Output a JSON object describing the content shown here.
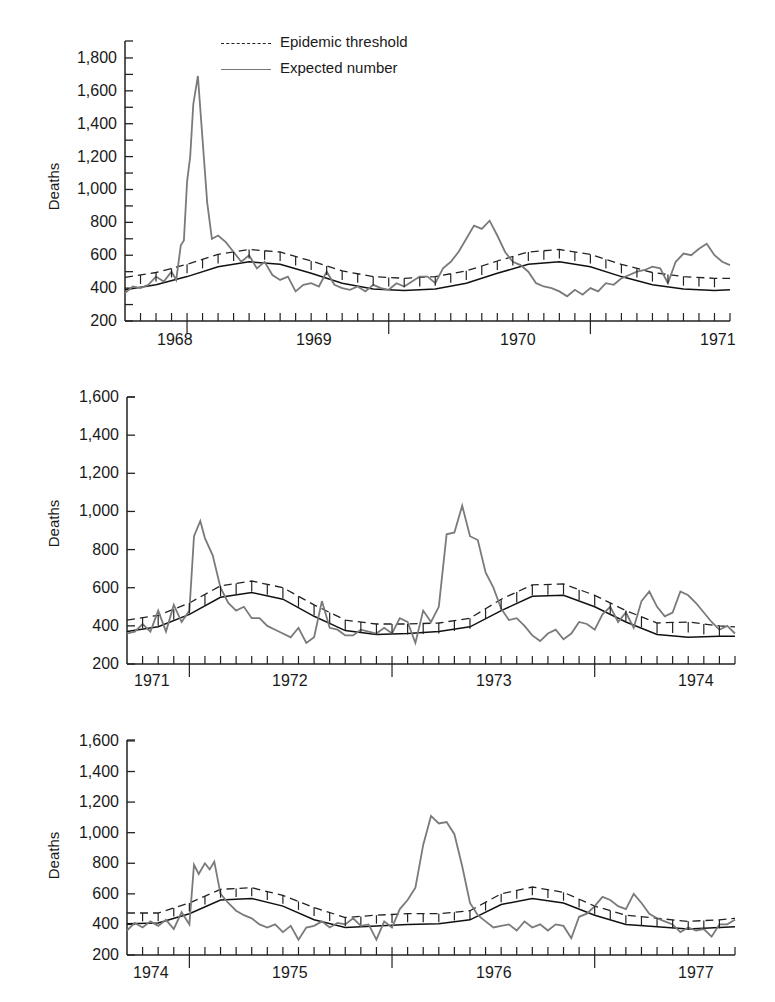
{
  "legend": {
    "threshold_label": "Epidemic threshold",
    "expected_label": "Expected number"
  },
  "colors": {
    "observed": "#7a7a7a",
    "expected": "#111111",
    "threshold": "#222222",
    "axis": "#222222"
  },
  "chart_data": [
    {
      "type": "line",
      "title": "",
      "xlabel": "",
      "ylabel": "Deaths",
      "ylim": [
        200,
        1900
      ],
      "yticks": [
        "200",
        "400",
        "600",
        "800",
        "1,000",
        "1,200",
        "1,400",
        "1,600",
        "1,800"
      ],
      "years": [
        "1968",
        "1969",
        "1970",
        "1971"
      ],
      "legend_position": "top",
      "grid": false,
      "periods_per_unit": "4-week periods (ticks)",
      "x_range_periods": [
        0,
        39
      ],
      "year_boundaries_periods": [
        4,
        17,
        30
      ],
      "series": [
        {
          "name": "Epidemic threshold",
          "style": "dashed",
          "x": [
            0,
            2,
            4,
            6,
            8,
            10,
            12,
            14,
            16,
            18,
            20,
            22,
            24,
            26,
            28,
            30,
            32,
            34,
            36,
            38,
            39
          ],
          "values": [
            465,
            495,
            545,
            605,
            635,
            620,
            565,
            505,
            470,
            460,
            470,
            505,
            565,
            620,
            635,
            605,
            545,
            495,
            470,
            460,
            460
          ]
        },
        {
          "name": "Expected number",
          "style": "solid",
          "x": [
            0,
            2,
            4,
            6,
            8,
            10,
            12,
            14,
            16,
            18,
            20,
            22,
            24,
            26,
            28,
            30,
            32,
            34,
            36,
            38,
            39
          ],
          "values": [
            390,
            420,
            470,
            530,
            560,
            545,
            490,
            430,
            395,
            385,
            395,
            430,
            490,
            545,
            560,
            530,
            470,
            420,
            395,
            385,
            390
          ]
        },
        {
          "name": "Observed",
          "style": "solid-gray",
          "x": [
            0,
            0.5,
            1,
            1.5,
            2,
            2.5,
            3,
            3.3,
            3.6,
            3.8,
            4,
            4.2,
            4.4,
            4.7,
            5,
            5.3,
            5.6,
            6,
            6.5,
            7,
            7.5,
            8,
            8.5,
            9,
            9.5,
            10,
            10.5,
            11,
            11.5,
            12,
            12.5,
            13,
            13.5,
            14,
            14.5,
            15,
            15.5,
            16,
            16.5,
            17,
            17.5,
            18,
            18.5,
            19,
            19.5,
            20,
            20.5,
            21,
            21.5,
            22,
            22.5,
            23,
            23.5,
            24,
            24.5,
            25,
            25.5,
            26,
            26.5,
            27,
            27.5,
            28,
            28.5,
            29,
            29.5,
            30,
            30.5,
            31,
            31.5,
            32,
            32.5,
            33,
            33.5,
            34,
            34.5,
            35,
            35.5,
            36,
            36.5,
            37,
            37.5,
            38,
            38.5,
            39
          ],
          "values": [
            370,
            410,
            400,
            420,
            470,
            440,
            500,
            450,
            660,
            690,
            1050,
            1200,
            1520,
            1690,
            1300,
            920,
            700,
            720,
            680,
            620,
            560,
            600,
            520,
            560,
            480,
            450,
            470,
            380,
            420,
            430,
            410,
            500,
            420,
            400,
            390,
            410,
            380,
            420,
            400,
            390,
            430,
            410,
            440,
            470,
            470,
            430,
            520,
            560,
            620,
            700,
            780,
            760,
            810,
            720,
            620,
            560,
            540,
            500,
            430,
            410,
            400,
            380,
            350,
            390,
            360,
            400,
            380,
            430,
            420,
            460,
            480,
            500,
            510,
            530,
            520,
            430,
            560,
            610,
            600,
            640,
            670,
            600,
            560,
            540,
            470,
            420,
            410,
            390,
            420,
            400,
            380,
            330
          ]
        }
      ]
    },
    {
      "type": "line",
      "title": "",
      "xlabel": "",
      "ylabel": "Deaths",
      "ylim": [
        200,
        1600
      ],
      "yticks": [
        "200",
        "400",
        "600",
        "800",
        "1,000",
        "1,200",
        "1,400",
        "1,600"
      ],
      "years": [
        "1971",
        "1972",
        "1973",
        "1974"
      ],
      "grid": false,
      "x_range_periods": [
        0,
        39
      ],
      "year_boundaries_periods": [
        4,
        17,
        30
      ],
      "series": [
        {
          "name": "Epidemic threshold",
          "style": "dashed",
          "x": [
            0,
            2,
            4,
            6,
            8,
            10,
            12,
            14,
            16,
            18,
            20,
            22,
            24,
            26,
            28,
            30,
            32,
            34,
            36,
            38,
            39
          ],
          "values": [
            430,
            455,
            520,
            610,
            635,
            600,
            510,
            430,
            410,
            410,
            415,
            440,
            540,
            615,
            620,
            560,
            480,
            415,
            420,
            400,
            395
          ]
        },
        {
          "name": "Expected number",
          "style": "solid",
          "x": [
            0,
            2,
            4,
            6,
            8,
            10,
            12,
            14,
            16,
            18,
            20,
            22,
            24,
            26,
            28,
            30,
            32,
            34,
            36,
            38,
            39
          ],
          "values": [
            370,
            395,
            460,
            550,
            575,
            540,
            450,
            375,
            355,
            360,
            370,
            395,
            480,
            555,
            560,
            500,
            420,
            355,
            340,
            345,
            345
          ]
        },
        {
          "name": "Observed",
          "style": "solid-gray",
          "x": [
            0,
            0.5,
            1,
            1.5,
            2,
            2.5,
            3,
            3.5,
            4,
            4.3,
            4.7,
            5,
            5.5,
            6,
            6.5,
            7,
            7.5,
            8,
            8.5,
            9,
            9.5,
            10,
            10.5,
            11,
            11.5,
            12,
            12.5,
            13,
            13.5,
            14,
            14.5,
            15,
            15.5,
            16,
            16.5,
            17,
            17.5,
            18,
            18.5,
            19,
            19.5,
            20,
            20.5,
            21,
            21.5,
            22,
            22.5,
            23,
            23.5,
            24,
            24.5,
            25,
            25.5,
            26,
            26.5,
            27,
            27.5,
            28,
            28.5,
            29,
            29.5,
            30,
            30.5,
            31,
            31.5,
            32,
            32.5,
            33,
            33.5,
            34,
            34.5,
            35,
            35.5,
            36,
            36.5,
            37,
            37.5,
            38,
            38.5,
            39
          ],
          "values": [
            360,
            370,
            410,
            370,
            480,
            370,
            510,
            420,
            480,
            870,
            950,
            860,
            770,
            600,
            520,
            480,
            500,
            440,
            440,
            400,
            380,
            360,
            340,
            390,
            310,
            340,
            530,
            390,
            380,
            350,
            350,
            380,
            370,
            360,
            390,
            360,
            440,
            420,
            310,
            480,
            420,
            500,
            880,
            890,
            1030,
            870,
            850,
            680,
            600,
            490,
            430,
            440,
            400,
            350,
            320,
            360,
            380,
            330,
            360,
            420,
            410,
            380,
            460,
            500,
            420,
            470,
            390,
            530,
            580,
            500,
            450,
            470,
            580,
            560,
            520,
            470,
            420,
            380,
            400,
            360,
            340,
            330,
            350
          ]
        }
      ]
    },
    {
      "type": "line",
      "title": "",
      "xlabel": "",
      "ylabel": "Deaths",
      "ylim": [
        200,
        1600
      ],
      "yticks": [
        "200",
        "400",
        "600",
        "800",
        "1,000",
        "1,200",
        "1,400",
        "1,600"
      ],
      "years": [
        "1974",
        "1975",
        "1976",
        "1977"
      ],
      "grid": false,
      "x_range_periods": [
        0,
        39
      ],
      "year_boundaries_periods": [
        4,
        17,
        30
      ],
      "series": [
        {
          "name": "Epidemic threshold",
          "style": "dashed",
          "x": [
            0,
            2,
            4,
            6,
            8,
            10,
            12,
            14,
            16,
            18,
            20,
            22,
            24,
            26,
            28,
            30,
            32,
            34,
            36,
            38,
            39
          ],
          "values": [
            475,
            475,
            540,
            630,
            640,
            590,
            510,
            445,
            460,
            470,
            470,
            490,
            600,
            645,
            610,
            520,
            460,
            440,
            420,
            430,
            440
          ]
        },
        {
          "name": "Expected number",
          "style": "solid",
          "x": [
            0,
            2,
            4,
            6,
            8,
            10,
            12,
            14,
            16,
            18,
            20,
            22,
            24,
            26,
            28,
            30,
            32,
            34,
            36,
            38,
            39
          ],
          "values": [
            405,
            410,
            470,
            560,
            570,
            520,
            430,
            380,
            390,
            400,
            405,
            430,
            530,
            570,
            540,
            460,
            400,
            385,
            370,
            380,
            385
          ]
        },
        {
          "name": "Observed",
          "style": "solid-gray",
          "x": [
            0,
            0.5,
            1,
            1.5,
            2,
            2.5,
            3,
            3.5,
            4,
            4.3,
            4.6,
            5,
            5.3,
            5.6,
            6,
            6.5,
            7,
            7.5,
            8,
            8.5,
            9,
            9.5,
            10,
            10.5,
            11,
            11.5,
            12,
            12.5,
            13,
            13.5,
            14,
            14.5,
            15,
            15.5,
            16,
            16.5,
            17,
            17.5,
            18,
            18.5,
            19,
            19.5,
            20,
            20.5,
            21,
            21.5,
            22,
            22.5,
            23,
            23.5,
            24,
            24.5,
            25,
            25.5,
            26,
            26.5,
            27,
            27.5,
            28,
            28.5,
            29,
            29.5,
            30,
            30.5,
            31,
            31.5,
            32,
            32.5,
            33,
            33.5,
            34,
            34.5,
            35,
            35.5,
            36,
            36.5,
            37,
            37.5,
            38,
            38.5,
            39
          ],
          "values": [
            360,
            410,
            380,
            420,
            390,
            430,
            370,
            480,
            400,
            790,
            730,
            800,
            760,
            810,
            600,
            540,
            490,
            460,
            440,
            400,
            380,
            400,
            350,
            390,
            300,
            380,
            390,
            420,
            380,
            410,
            400,
            440,
            390,
            400,
            300,
            420,
            380,
            500,
            560,
            640,
            920,
            1110,
            1060,
            1070,
            990,
            780,
            540,
            460,
            420,
            380,
            390,
            400,
            360,
            420,
            380,
            400,
            360,
            400,
            390,
            310,
            450,
            470,
            520,
            580,
            560,
            520,
            500,
            600,
            540,
            470,
            440,
            420,
            400,
            350,
            380,
            360,
            370,
            320,
            400,
            400,
            430,
            400,
            380
          ]
        }
      ]
    }
  ],
  "panels": [
    {
      "ylabel": "Deaths",
      "yticks": [
        {
          "v": 200,
          "label": "200"
        },
        {
          "v": 400,
          "label": "400"
        },
        {
          "v": 600,
          "label": "600"
        },
        {
          "v": 800,
          "label": "800"
        },
        {
          "v": 1000,
          "label": "1,000"
        },
        {
          "v": 1200,
          "label": "1,200"
        },
        {
          "v": 1400,
          "label": "1,400"
        },
        {
          "v": 1600,
          "label": "1,600"
        },
        {
          "v": 1800,
          "label": "1,800"
        }
      ],
      "years": [
        "1968",
        "1969",
        "1970",
        "1971"
      ]
    },
    {
      "ylabel": "Deaths",
      "yticks": [
        {
          "v": 200,
          "label": "200"
        },
        {
          "v": 400,
          "label": "400"
        },
        {
          "v": 600,
          "label": "600"
        },
        {
          "v": 800,
          "label": "800"
        },
        {
          "v": 1000,
          "label": "1,000"
        },
        {
          "v": 1200,
          "label": "1,200"
        },
        {
          "v": 1400,
          "label": "1,400"
        },
        {
          "v": 1600,
          "label": "1,600"
        }
      ],
      "years": [
        "1971",
        "1972",
        "1973",
        "1974"
      ]
    },
    {
      "ylabel": "Deaths",
      "yticks": [
        {
          "v": 200,
          "label": "200"
        },
        {
          "v": 400,
          "label": "400"
        },
        {
          "v": 600,
          "label": "600"
        },
        {
          "v": 800,
          "label": "800"
        },
        {
          "v": 1000,
          "label": "1,000"
        },
        {
          "v": 1200,
          "label": "1,200"
        },
        {
          "v": 1400,
          "label": "1,400"
        },
        {
          "v": 1600,
          "label": "1,600"
        }
      ],
      "years": [
        "1974",
        "1975",
        "1976",
        "1977"
      ]
    }
  ]
}
